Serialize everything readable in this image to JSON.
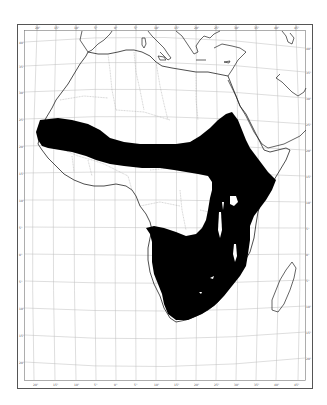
{
  "map": {
    "region": "Africa",
    "projection": "conic graticule",
    "colors": {
      "background": "#ffffff",
      "range_fill": "#000000",
      "coastline": "#222222",
      "borders": "#9a9a9a",
      "graticule": "#b8b8b8",
      "frame": "#555555"
    },
    "top_ticks": [
      "20°",
      "15°",
      "10°",
      "5°",
      "0°",
      "5°",
      "10°",
      "15°",
      "20°",
      "25°",
      "30°",
      "35°",
      "40°",
      "45°",
      "50°",
      "55°"
    ],
    "bottom_ticks": [
      "20°",
      "15°",
      "10°",
      "5°",
      "0°",
      "5°",
      "10°",
      "15°",
      "20°",
      "25°",
      "30°",
      "35°",
      "40°",
      "45°",
      "50°",
      "55°"
    ],
    "left_ticks": [
      "40°",
      "35°",
      "30°",
      "25°",
      "20°",
      "15°",
      "10°",
      "5°",
      "0°",
      "5°",
      "10°",
      "15°",
      "20°",
      "25°",
      "30°",
      "35°"
    ],
    "right_ticks": [
      "40°",
      "35°",
      "30°",
      "25°",
      "20°",
      "15°",
      "10°",
      "5°",
      "0°",
      "5°",
      "10°",
      "15°",
      "20°",
      "25°",
      "30°",
      "35°"
    ],
    "shaded_range": "Sahel belt from Senegal to Ethiopia/Somalia, south through East African Rift to southern Africa"
  }
}
